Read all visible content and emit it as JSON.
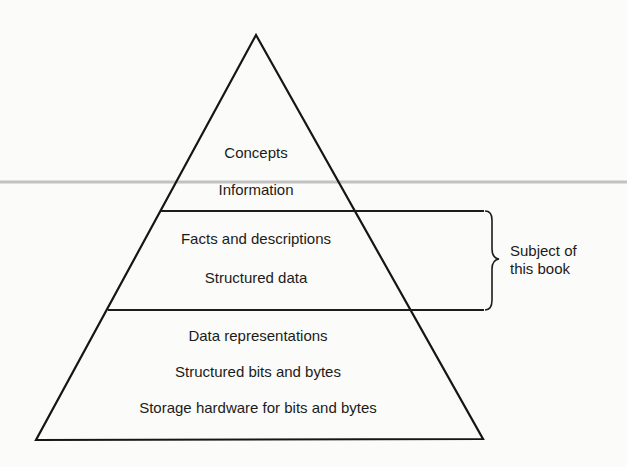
{
  "diagram": {
    "type": "pyramid",
    "levels": [
      {
        "name": "top",
        "lines": [
          "Concepts",
          "Information"
        ]
      },
      {
        "name": "middle",
        "lines": [
          "Facts and descriptions",
          "Structured data"
        ]
      },
      {
        "name": "bottom",
        "lines": [
          "Data representations",
          "Structured bits and bytes",
          "Storage hardware for bits and bytes"
        ]
      }
    ],
    "annotation": {
      "applies_to_level": "middle",
      "lines": [
        "Subject of",
        "this book"
      ]
    }
  }
}
